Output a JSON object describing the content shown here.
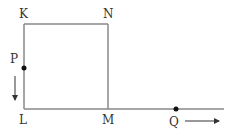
{
  "diagram": {
    "type": "geometry-motion",
    "square": {
      "vertices": [
        "K",
        "N",
        "M",
        "L"
      ]
    },
    "labels": {
      "K": "K",
      "N": "N",
      "L": "L",
      "M": "M",
      "P": "P",
      "Q": "Q"
    },
    "moving_points": [
      {
        "name": "P",
        "on_segment": "KL",
        "direction": "down"
      },
      {
        "name": "Q",
        "on_ray": "LM extended",
        "direction": "right"
      }
    ],
    "colors": {
      "line": "#888888",
      "point": "#111111",
      "text": "#333333"
    }
  }
}
